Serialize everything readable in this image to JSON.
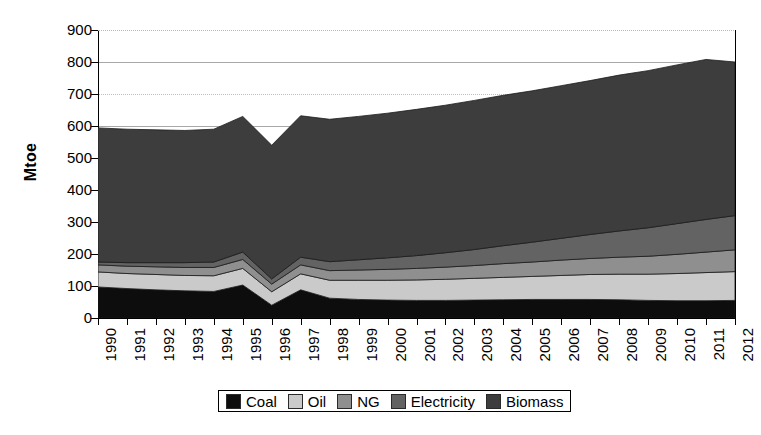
{
  "chart_data": {
    "type": "area",
    "stacked": true,
    "title": "",
    "xlabel": "",
    "ylabel": "Mtoe",
    "ylim": [
      0,
      900
    ],
    "ytick_step": 100,
    "yticks": [
      0,
      100,
      200,
      300,
      400,
      500,
      600,
      700,
      800,
      900
    ],
    "grid": "horizontal",
    "legend_position": "bottom",
    "categories": [
      "1990",
      "1991",
      "1992",
      "1993",
      "1994",
      "1995",
      "1996",
      "1997",
      "1998",
      "1999",
      "2000",
      "2001",
      "2002",
      "2003",
      "2004",
      "2005",
      "2006",
      "2007",
      "2008",
      "2009",
      "2010",
      "2011",
      "2012"
    ],
    "series": [
      {
        "name": "Coal",
        "color": "#0d0d0d",
        "values": [
          97,
          92,
          88,
          85,
          83,
          103,
          40,
          88,
          62,
          58,
          56,
          55,
          55,
          56,
          57,
          58,
          58,
          58,
          57,
          55,
          54,
          54,
          55
        ]
      },
      {
        "name": "Oil",
        "color": "#cacaca",
        "values": [
          47,
          47,
          48,
          48,
          49,
          52,
          42,
          50,
          56,
          60,
          62,
          64,
          66,
          68,
          70,
          72,
          75,
          78,
          80,
          82,
          85,
          88,
          90
        ]
      },
      {
        "name": "NG",
        "color": "#8f8f8f",
        "values": [
          22,
          23,
          24,
          25,
          26,
          28,
          24,
          28,
          30,
          32,
          34,
          36,
          38,
          40,
          43,
          45,
          48,
          50,
          53,
          56,
          60,
          64,
          68
        ]
      },
      {
        "name": "Electricity",
        "color": "#636363",
        "values": [
          9,
          11,
          13,
          15,
          17,
          23,
          16,
          24,
          28,
          32,
          36,
          40,
          45,
          50,
          56,
          62,
          68,
          75,
          82,
          89,
          96,
          102,
          107
        ]
      },
      {
        "name": "Biomass",
        "color": "#3d3d3d",
        "values": [
          419,
          417,
          415,
          413,
          415,
          424,
          418,
          442,
          445,
          448,
          452,
          457,
          461,
          466,
          470,
          473,
          477,
          481,
          487,
          491,
          496,
          500,
          480
        ]
      }
    ],
    "totals": [
      594,
      590,
      588,
      586,
      590,
      630,
      540,
      632,
      621,
      630,
      640,
      652,
      665,
      680,
      696,
      710,
      726,
      742,
      759,
      773,
      791,
      808,
      800
    ]
  },
  "legend": {
    "items": [
      {
        "label": "Coal",
        "swatch": "#0d0d0d"
      },
      {
        "label": "Oil",
        "swatch": "#cacaca"
      },
      {
        "label": "NG",
        "swatch": "#8f8f8f"
      },
      {
        "label": "Electricity",
        "swatch": "#636363"
      },
      {
        "label": "Biomass",
        "swatch": "#3d3d3d"
      }
    ]
  },
  "axes": {
    "y_title": "Mtoe",
    "y_labels": [
      "900",
      "800",
      "700",
      "600",
      "500",
      "400",
      "300",
      "200",
      "100",
      "0"
    ],
    "x_labels": [
      "1990",
      "1991",
      "1992",
      "1993",
      "1994",
      "1995",
      "1996",
      "1997",
      "1998",
      "1999",
      "2000",
      "2001",
      "2002",
      "2003",
      "2004",
      "2005",
      "2006",
      "2007",
      "2008",
      "2009",
      "2010",
      "2011",
      "2012"
    ]
  }
}
